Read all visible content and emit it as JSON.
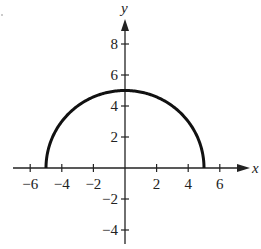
{
  "chart_data": {
    "type": "line",
    "title": "",
    "xlabel": "x",
    "ylabel": "y",
    "xlim": [
      -7,
      7.8
    ],
    "ylim": [
      -5,
      10
    ],
    "grid": false,
    "legend": null,
    "x_ticks": [
      -6,
      -4,
      -2,
      2,
      4,
      6
    ],
    "x_tick_labels": [
      "−6",
      "−4",
      "−2",
      "2",
      "4",
      "6"
    ],
    "y_ticks": [
      8,
      6,
      4,
      2,
      -2,
      -4
    ],
    "y_tick_labels": [
      "8",
      "6",
      "4",
      "2",
      "−2",
      "−4"
    ],
    "series": [
      {
        "name": "semicircle",
        "x": [
          -5,
          -4,
          -3,
          -2,
          -1,
          0,
          1,
          2,
          3,
          4,
          5
        ],
        "y": [
          0,
          3,
          4,
          4.58,
          4.9,
          5,
          4.9,
          4.58,
          4,
          3,
          0
        ]
      }
    ],
    "colors": {
      "curve": "#111111",
      "axes": "#222222"
    }
  }
}
